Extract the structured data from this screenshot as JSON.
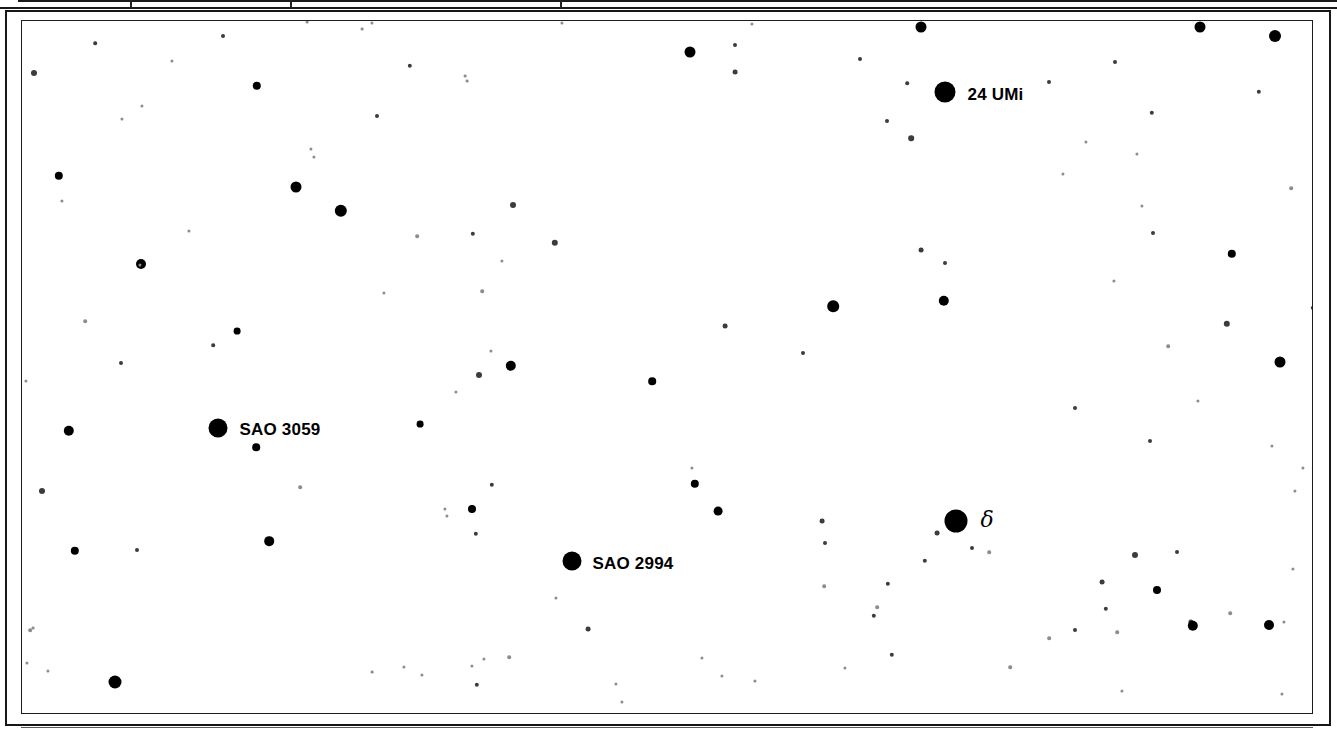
{
  "chart_data": {
    "type": "scatter",
    "xlabel": "",
    "ylabel": "",
    "xlim": [
      0,
      1292
    ],
    "ylim": [
      0,
      694
    ],
    "grid": false,
    "legend": null,
    "background_color": "#ffffff",
    "star_color": "#000000",
    "frame_color": "#1c1c1c",
    "labeled_stars": [
      {
        "name": "24 UMi",
        "x": 923,
        "y": 71,
        "r": 10.5,
        "label_dx": 12,
        "label_dy": -6
      },
      {
        "name": "SAO 3059",
        "x": 196,
        "y": 407,
        "r": 9.5,
        "label_dx": 12,
        "label_dy": -7
      },
      {
        "name": "SAO 2994",
        "x": 550,
        "y": 540,
        "r": 9.5,
        "label_dx": 11,
        "label_dy": -6
      },
      {
        "name": "δ",
        "x": 934,
        "y": 500,
        "r": 11.5,
        "label_dx": 13,
        "label_dy": -12
      }
    ],
    "stars": [
      {
        "x": 899,
        "y": 6,
        "r": 5.5
      },
      {
        "x": 668,
        "y": 31,
        "r": 5.5
      },
      {
        "x": 1178,
        "y": 6,
        "r": 5.5
      },
      {
        "x": 1253,
        "y": 15,
        "r": 6.0
      },
      {
        "x": 201,
        "y": 15,
        "r": 2.0,
        "c": "faint"
      },
      {
        "x": 350,
        "y": 2,
        "r": 1.6,
        "c": "veryfaint"
      },
      {
        "x": 540,
        "y": 2,
        "r": 1.6,
        "c": "veryfaint"
      },
      {
        "x": 730,
        "y": 3,
        "r": 1.6,
        "c": "veryfaint"
      },
      {
        "x": 285,
        "y": 1,
        "r": 1.4,
        "c": "veryfaint"
      },
      {
        "x": 73,
        "y": 22,
        "r": 1.8,
        "c": "faint"
      },
      {
        "x": 713,
        "y": 24,
        "r": 2.0,
        "c": "faint"
      },
      {
        "x": 1093,
        "y": 41,
        "r": 2.0,
        "c": "faint"
      },
      {
        "x": 713,
        "y": 51,
        "r": 2.4,
        "c": "faint"
      },
      {
        "x": 150,
        "y": 40,
        "r": 1.6,
        "c": "veryfaint"
      },
      {
        "x": 388,
        "y": 45,
        "r": 2.2,
        "c": "faint"
      },
      {
        "x": 235,
        "y": 65,
        "r": 4.2
      },
      {
        "x": 12,
        "y": 52,
        "r": 3.0,
        "c": "faint"
      },
      {
        "x": 885,
        "y": 62,
        "r": 1.8,
        "c": "faint"
      },
      {
        "x": 1027,
        "y": 61,
        "r": 2.0,
        "c": "faint"
      },
      {
        "x": 120,
        "y": 85,
        "r": 1.6,
        "c": "veryfaint"
      },
      {
        "x": 1130,
        "y": 92,
        "r": 2.2,
        "c": "faint"
      },
      {
        "x": 1237,
        "y": 71,
        "r": 2.2,
        "c": "faint"
      },
      {
        "x": 274,
        "y": 166,
        "r": 5.5
      },
      {
        "x": 319,
        "y": 190,
        "r": 6.2
      },
      {
        "x": 1115,
        "y": 133,
        "r": 1.6,
        "c": "veryfaint"
      },
      {
        "x": 445,
        "y": 60,
        "r": 1.4,
        "c": "veryfaint"
      },
      {
        "x": 491,
        "y": 184,
        "r": 3.0,
        "c": "faint"
      },
      {
        "x": 443,
        "y": 55,
        "r": 1.4,
        "c": "veryfaint"
      },
      {
        "x": 533,
        "y": 222,
        "r": 3.2,
        "c": "faint"
      },
      {
        "x": 451,
        "y": 213,
        "r": 2.2,
        "c": "faint"
      },
      {
        "x": 119,
        "y": 243,
        "r": 5.0
      },
      {
        "x": 215,
        "y": 310,
        "r": 3.4
      },
      {
        "x": 191,
        "y": 324,
        "r": 1.8,
        "c": "faint"
      },
      {
        "x": 37,
        "y": 155,
        "r": 4.2
      },
      {
        "x": 1064,
        "y": 121,
        "r": 1.6,
        "c": "veryfaint"
      },
      {
        "x": 838,
        "y": 38,
        "r": 2.0,
        "c": "faint"
      },
      {
        "x": 889,
        "y": 117,
        "r": 2.8,
        "c": "faint"
      },
      {
        "x": 865,
        "y": 100,
        "r": 2.0,
        "c": "faint"
      },
      {
        "x": 899,
        "y": 229,
        "r": 2.4,
        "c": "faint"
      },
      {
        "x": 922,
        "y": 280,
        "r": 5.2
      },
      {
        "x": 811,
        "y": 285,
        "r": 5.8
      },
      {
        "x": 923,
        "y": 242,
        "r": 2.0,
        "c": "faint"
      },
      {
        "x": 1041,
        "y": 153,
        "r": 1.6,
        "c": "veryfaint"
      },
      {
        "x": 1210,
        "y": 233,
        "r": 4.2
      },
      {
        "x": 1258,
        "y": 341,
        "r": 5.5
      },
      {
        "x": 1205,
        "y": 303,
        "r": 3.2,
        "c": "faint"
      },
      {
        "x": 1131,
        "y": 212,
        "r": 2.0,
        "c": "faint"
      },
      {
        "x": 1120,
        "y": 185,
        "r": 1.6,
        "c": "veryfaint"
      },
      {
        "x": 1092,
        "y": 260,
        "r": 1.6,
        "c": "veryfaint"
      },
      {
        "x": 1146,
        "y": 325,
        "r": 1.8,
        "c": "veryfaint"
      },
      {
        "x": 1176,
        "y": 380,
        "r": 1.6,
        "c": "veryfaint"
      },
      {
        "x": 1128,
        "y": 420,
        "r": 2.0,
        "c": "faint"
      },
      {
        "x": 1250,
        "y": 425,
        "r": 1.6,
        "c": "veryfaint"
      },
      {
        "x": 1053,
        "y": 387,
        "r": 2.0,
        "c": "faint"
      },
      {
        "x": 489,
        "y": 345,
        "r": 5.2
      },
      {
        "x": 457,
        "y": 354,
        "r": 3.0,
        "c": "faint"
      },
      {
        "x": 469,
        "y": 330,
        "r": 1.6,
        "c": "veryfaint"
      },
      {
        "x": 630,
        "y": 360,
        "r": 3.8
      },
      {
        "x": 398,
        "y": 403,
        "r": 3.4
      },
      {
        "x": 434,
        "y": 371,
        "r": 1.6,
        "c": "veryfaint"
      },
      {
        "x": 703,
        "y": 305,
        "r": 2.4,
        "c": "faint"
      },
      {
        "x": 781,
        "y": 332,
        "r": 2.0,
        "c": "faint"
      },
      {
        "x": 460,
        "y": 270,
        "r": 1.8,
        "c": "veryfaint"
      },
      {
        "x": 362,
        "y": 272,
        "r": 1.6,
        "c": "veryfaint"
      },
      {
        "x": 395,
        "y": 215,
        "r": 1.8,
        "c": "veryfaint"
      },
      {
        "x": 340,
        "y": 8,
        "r": 1.4,
        "c": "veryfaint"
      },
      {
        "x": 99,
        "y": 342,
        "r": 2.0,
        "c": "faint"
      },
      {
        "x": 234,
        "y": 426,
        "r": 3.8
      },
      {
        "x": 47,
        "y": 410,
        "r": 5.2
      },
      {
        "x": 292,
        "y": 136,
        "r": 1.6,
        "c": "veryfaint"
      },
      {
        "x": 63,
        "y": 300,
        "r": 1.8,
        "c": "veryfaint"
      },
      {
        "x": 355,
        "y": 95,
        "r": 2.0,
        "c": "faint"
      },
      {
        "x": 100,
        "y": 98,
        "r": 1.6,
        "c": "veryfaint"
      },
      {
        "x": 289,
        "y": 128,
        "r": 1.6,
        "c": "veryfaint"
      },
      {
        "x": 4,
        "y": 360,
        "r": 1.6,
        "c": "veryfaint"
      },
      {
        "x": 118,
        "y": 244,
        "r": 1.6,
        "c": "veryfaint"
      },
      {
        "x": 20,
        "y": 470,
        "r": 3.0,
        "c": "faint"
      },
      {
        "x": 53,
        "y": 530,
        "r": 4.2
      },
      {
        "x": 115,
        "y": 529,
        "r": 2.0,
        "c": "faint"
      },
      {
        "x": 247,
        "y": 520,
        "r": 4.8
      },
      {
        "x": 278,
        "y": 466,
        "r": 1.8,
        "c": "veryfaint"
      },
      {
        "x": 8,
        "y": 609,
        "r": 1.8,
        "c": "veryfaint"
      },
      {
        "x": 93,
        "y": 661,
        "r": 6.5
      },
      {
        "x": 5,
        "y": 642,
        "r": 1.6,
        "c": "veryfaint"
      },
      {
        "x": 26,
        "y": 650,
        "r": 1.6,
        "c": "veryfaint"
      },
      {
        "x": 11,
        "y": 607,
        "r": 1.4,
        "c": "veryfaint"
      },
      {
        "x": 450,
        "y": 488,
        "r": 4.0
      },
      {
        "x": 454,
        "y": 513,
        "r": 2.2,
        "c": "faint"
      },
      {
        "x": 425,
        "y": 495,
        "r": 1.6,
        "c": "veryfaint"
      },
      {
        "x": 423,
        "y": 488,
        "r": 1.6,
        "c": "veryfaint"
      },
      {
        "x": 673,
        "y": 463,
        "r": 4.2
      },
      {
        "x": 670,
        "y": 447,
        "r": 1.6,
        "c": "veryfaint"
      },
      {
        "x": 470,
        "y": 464,
        "r": 2.2,
        "c": "faint"
      },
      {
        "x": 551,
        "y": 545,
        "r": 1.8,
        "c": "veryfaint"
      },
      {
        "x": 566,
        "y": 608,
        "r": 2.4,
        "c": "faint"
      },
      {
        "x": 487,
        "y": 636,
        "r": 1.8,
        "c": "veryfaint"
      },
      {
        "x": 462,
        "y": 638,
        "r": 1.6,
        "c": "veryfaint"
      },
      {
        "x": 450,
        "y": 645,
        "r": 1.6,
        "c": "veryfaint"
      },
      {
        "x": 455,
        "y": 664,
        "r": 2.2,
        "c": "faint"
      },
      {
        "x": 400,
        "y": 654,
        "r": 1.6,
        "c": "veryfaint"
      },
      {
        "x": 594,
        "y": 663,
        "r": 1.6,
        "c": "veryfaint"
      },
      {
        "x": 680,
        "y": 637,
        "r": 1.6,
        "c": "veryfaint"
      },
      {
        "x": 700,
        "y": 655,
        "r": 1.6,
        "c": "veryfaint"
      },
      {
        "x": 600,
        "y": 681,
        "r": 1.6,
        "c": "veryfaint"
      },
      {
        "x": 382,
        "y": 646,
        "r": 1.6,
        "c": "veryfaint"
      },
      {
        "x": 350,
        "y": 651,
        "r": 1.4,
        "c": "veryfaint"
      },
      {
        "x": 534,
        "y": 577,
        "r": 1.6,
        "c": "veryfaint"
      },
      {
        "x": 696,
        "y": 490,
        "r": 4.4
      },
      {
        "x": 800,
        "y": 500,
        "r": 2.4,
        "c": "faint"
      },
      {
        "x": 803,
        "y": 522,
        "r": 2.0,
        "c": "faint"
      },
      {
        "x": 866,
        "y": 563,
        "r": 2.2,
        "c": "faint"
      },
      {
        "x": 852,
        "y": 595,
        "r": 2.2,
        "c": "faint"
      },
      {
        "x": 870,
        "y": 634,
        "r": 2.2,
        "c": "faint"
      },
      {
        "x": 855,
        "y": 586,
        "r": 1.8,
        "c": "veryfaint"
      },
      {
        "x": 823,
        "y": 647,
        "r": 1.6,
        "c": "veryfaint"
      },
      {
        "x": 802,
        "y": 565,
        "r": 1.8,
        "c": "veryfaint"
      },
      {
        "x": 903,
        "y": 540,
        "r": 2.2,
        "c": "faint"
      },
      {
        "x": 915,
        "y": 512,
        "r": 2.4,
        "c": "faint"
      },
      {
        "x": 950,
        "y": 527,
        "r": 2.0,
        "c": "faint"
      },
      {
        "x": 967,
        "y": 531,
        "r": 1.8,
        "c": "veryfaint"
      },
      {
        "x": 1053,
        "y": 609,
        "r": 2.0,
        "c": "faint"
      },
      {
        "x": 1208,
        "y": 592,
        "r": 1.8,
        "c": "veryfaint"
      },
      {
        "x": 1095,
        "y": 611,
        "r": 1.8,
        "c": "veryfaint"
      },
      {
        "x": 1113,
        "y": 534,
        "r": 3.0,
        "c": "faint"
      },
      {
        "x": 1135,
        "y": 569,
        "r": 4.0
      },
      {
        "x": 1080,
        "y": 561,
        "r": 2.4,
        "c": "faint"
      },
      {
        "x": 1084,
        "y": 588,
        "r": 2.2,
        "c": "faint"
      },
      {
        "x": 1155,
        "y": 531,
        "r": 2.0,
        "c": "faint"
      },
      {
        "x": 1169,
        "y": 601,
        "r": 2.6,
        "c": "faint"
      },
      {
        "x": 1171,
        "y": 605,
        "r": 5.2
      },
      {
        "x": 1247,
        "y": 604,
        "r": 5.0
      },
      {
        "x": 1027,
        "y": 617,
        "r": 1.8,
        "c": "veryfaint"
      },
      {
        "x": 1271,
        "y": 548,
        "r": 1.6,
        "c": "veryfaint"
      },
      {
        "x": 1262,
        "y": 601,
        "r": 1.6,
        "c": "veryfaint"
      },
      {
        "x": 988,
        "y": 646,
        "r": 1.8,
        "c": "veryfaint"
      },
      {
        "x": 1100,
        "y": 670,
        "r": 1.6,
        "c": "veryfaint"
      },
      {
        "x": 1260,
        "y": 673,
        "r": 1.6,
        "c": "veryfaint"
      },
      {
        "x": 733,
        "y": 660,
        "r": 1.6,
        "c": "veryfaint"
      },
      {
        "x": 480,
        "y": 240,
        "r": 1.6,
        "c": "veryfaint"
      },
      {
        "x": 167,
        "y": 210,
        "r": 1.6,
        "c": "veryfaint"
      },
      {
        "x": 40,
        "y": 180,
        "r": 1.6,
        "c": "veryfaint"
      },
      {
        "x": 1291,
        "y": 287,
        "r": 2.2,
        "c": "faint"
      },
      {
        "x": 1269,
        "y": 167,
        "r": 1.8,
        "c": "veryfaint"
      },
      {
        "x": 1281,
        "y": 447,
        "r": 1.6,
        "c": "veryfaint"
      },
      {
        "x": 1273,
        "y": 470,
        "r": 1.6,
        "c": "veryfaint"
      }
    ]
  },
  "frame": {
    "table_dividers": [
      130,
      290,
      560
    ]
  }
}
